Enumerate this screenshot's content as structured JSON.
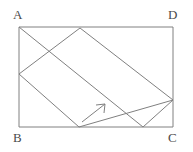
{
  "figure": {
    "canvas": {
      "width": 193,
      "height": 152
    },
    "style": {
      "background_color": "#ffffff",
      "line_color": "#808080",
      "label_color": "#4a4a4a",
      "line_width": 1
    },
    "labels": {
      "A": "A",
      "B": "B",
      "C": "C",
      "D": "D"
    },
    "points": {
      "A": {
        "x": 19,
        "y": 27,
        "name": "A"
      },
      "D": {
        "x": 173,
        "y": 27,
        "name": "D"
      },
      "C": {
        "x": 173,
        "y": 127,
        "name": "C"
      },
      "B": {
        "x": 19,
        "y": 127,
        "name": "B"
      },
      "P_left": {
        "x": 19,
        "y": 74,
        "name": "P-left-edge"
      },
      "Q_top": {
        "x": 80,
        "y": 28,
        "name": "Q-top-edge"
      },
      "R_right": {
        "x": 173,
        "y": 100,
        "name": "R-right-edge"
      },
      "S_bottom": {
        "x": 79,
        "y": 127,
        "name": "S-bottom-edge"
      },
      "T_bottom": {
        "x": 143,
        "y": 127,
        "name": "T-bottom-edge"
      }
    },
    "rectangle": {
      "name": "rectangle-ABCD",
      "path": "M 19 27 L 173 27 L 173 127 L 19 127 Z"
    },
    "segments": [
      {
        "name": "segment-A-to-T",
        "from": "A",
        "to": "T_bottom",
        "d": "M 19 27 L 143 127"
      },
      {
        "name": "segment-P-to-S",
        "from": "P_left",
        "to": "S_bottom",
        "d": "M 19 74 L 79 127"
      },
      {
        "name": "segment-P-to-Q",
        "from": "P_left",
        "to": "Q_top",
        "d": "M 19 74 L 80 28"
      },
      {
        "name": "segment-Q-to-R",
        "from": "Q_top",
        "to": "R_right",
        "d": "M 80 28 L 173 100"
      },
      {
        "name": "segment-S-to-R",
        "from": "S_bottom",
        "to": "R_right",
        "d": "M 79 127 L 173 100"
      },
      {
        "name": "segment-T-to-R",
        "from": "T_bottom",
        "to": "R_right",
        "d": "M 143 127 L 173 100"
      }
    ],
    "arrow": {
      "name": "direction-arrow",
      "from": {
        "x": 82,
        "y": 122
      },
      "to": {
        "x": 105,
        "y": 104
      },
      "shaft_d": "M 82 122 L 105 104",
      "head_d": "M 105 104 L 96 105 M 105 104 L 104 113",
      "description": "arrow pointing up and to the right"
    }
  }
}
